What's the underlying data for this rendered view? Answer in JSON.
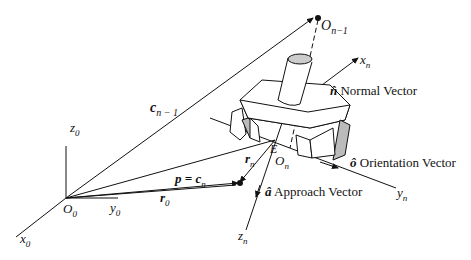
{
  "diagram": {
    "type": "robot end-effector coordinate frames",
    "origin_frame": {
      "origin": "O",
      "origin_sub": "0",
      "x": "x",
      "x_sub": "0",
      "y": "y",
      "y_sub": "0",
      "z": "z",
      "z_sub": "0"
    },
    "prev_frame": {
      "origin": "O",
      "origin_sub": "n−1"
    },
    "tool_frame": {
      "origin": "O",
      "origin_sub": "n",
      "x": "x",
      "x_sub": "n",
      "y": "y",
      "y_sub": "n",
      "z": "z",
      "z_sub": "n",
      "point_E": "E"
    },
    "vectors": {
      "c_prev": {
        "sym": "c",
        "sub": "n − 1"
      },
      "p_eq": {
        "sym": "p = c",
        "sub": "n"
      },
      "r0": {
        "sym": "r",
        "sub": "0"
      },
      "rn": {
        "sym": "r",
        "sub": "n"
      }
    },
    "unit_vectors": {
      "normal": {
        "sym": "n̂",
        "label": "Normal Vector"
      },
      "orientation": {
        "sym": "ô",
        "label": "Orientation Vector"
      },
      "approach": {
        "sym": "â",
        "label": "Approach Vector"
      }
    }
  }
}
